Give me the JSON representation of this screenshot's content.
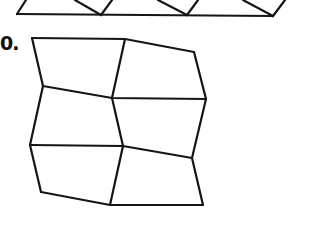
{
  "problem": {
    "number_label": "0.",
    "description": "Tessellation of irregular quadrilaterals arranged in a 2x3 grid"
  },
  "colors": {
    "stroke": "#151515",
    "background": "#ffffff"
  },
  "top_strip": {
    "description": "Partially visible row of triangles from previous figure"
  }
}
